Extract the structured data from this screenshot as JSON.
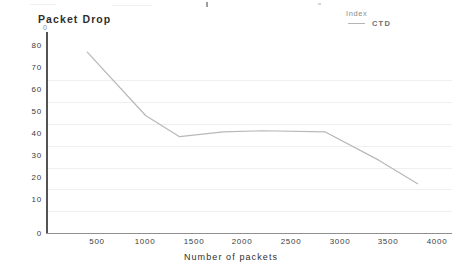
{
  "chart_data": {
    "type": "line",
    "title": "",
    "xlabel": "Number of packets",
    "ylabel": "Packet Drop",
    "ylabel_secondary": "0",
    "xlim": [
      0,
      4100
    ],
    "ylim": [
      0,
      85
    ],
    "grid": true,
    "grid_axis": "y",
    "legend_position": "top-right",
    "legend_title": "Index",
    "x_ticks": [
      500,
      1000,
      1500,
      2000,
      2500,
      3000,
      3500,
      4000
    ],
    "x_tick_labels": [
      "500",
      "1000",
      "1500",
      "2000",
      "2500",
      "3000",
      "3500",
      "4000"
    ],
    "y_ticks": [
      0,
      10,
      20,
      30,
      40,
      50,
      60,
      70,
      80
    ],
    "y_tick_labels": [
      "0",
      "10",
      "20",
      "30",
      "40",
      "50",
      "60",
      "70",
      "80"
    ],
    "line_color": "#b8b8b8",
    "series": [
      {
        "name": "CTD",
        "color": "#b8b8b8",
        "x": [
          400,
          1000,
          1350,
          1800,
          2200,
          2850,
          3400,
          3800
        ],
        "values": [
          77,
          50,
          41,
          43,
          43.5,
          43,
          31,
          21
        ],
        "points": [
          {
            "x": 400,
            "y": 77
          },
          {
            "x": 1000,
            "y": 50
          },
          {
            "x": 1350,
            "y": 41
          },
          {
            "x": 1800,
            "y": 43
          },
          {
            "x": 2200,
            "y": 43.5
          },
          {
            "x": 2850,
            "y": 43
          },
          {
            "x": 3400,
            "y": 31
          },
          {
            "x": 3800,
            "y": 21
          }
        ]
      }
    ]
  },
  "legend": {
    "title": "Index",
    "entries": [
      {
        "label": "CTD",
        "marker": "line",
        "color": "#b8b8b8"
      }
    ]
  },
  "axes": {
    "y_title": "Packet Drop",
    "y_sub_mark": "0",
    "x_title": "Number of packets"
  }
}
